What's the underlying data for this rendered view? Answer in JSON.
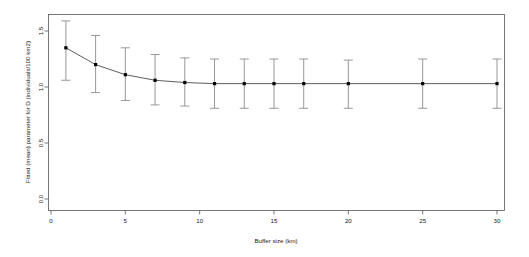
{
  "chart_data": {
    "type": "line",
    "title": "",
    "subtitle": "",
    "xlabel": "Buffer size (km)",
    "ylabel": "Fitted (mean) parameter for D (individuals/100 km2)",
    "xlim": [
      0,
      30
    ],
    "ylim": [
      0.0,
      1.65
    ],
    "grid": false,
    "legend": null,
    "x": [
      1,
      3,
      5,
      7,
      9,
      11,
      13,
      15,
      17,
      20,
      25,
      30
    ],
    "values": [
      1.35,
      1.2,
      1.11,
      1.06,
      1.04,
      1.03,
      1.03,
      1.03,
      1.03,
      1.03,
      1.03,
      1.03
    ],
    "error_lower": [
      1.06,
      0.95,
      0.88,
      0.84,
      0.83,
      0.81,
      0.81,
      0.81,
      0.81,
      0.81,
      0.81,
      0.81
    ],
    "error_upper": [
      1.59,
      1.46,
      1.35,
      1.29,
      1.26,
      1.25,
      1.25,
      1.25,
      1.25,
      1.24,
      1.25,
      1.25
    ],
    "series": [
      {
        "name": "Fitted (mean) parameter for D",
        "values": [
          1.35,
          1.2,
          1.11,
          1.06,
          1.04,
          1.03,
          1.03,
          1.03,
          1.03,
          1.03,
          1.03,
          1.03
        ]
      }
    ],
    "xticks": [
      0,
      5,
      10,
      15,
      20,
      25,
      30
    ],
    "xticklabels": [
      "0",
      "5",
      "10",
      "15",
      "20",
      "25",
      "30"
    ],
    "yticks": [
      0.0,
      0.5,
      1.0,
      1.5
    ],
    "yticklabels": [
      "0.0",
      "0.5",
      "1.0",
      "1.5"
    ],
    "marker": "filled-square",
    "errorbar_style": "capped-vertical",
    "colors": {
      "point": "#000000",
      "line": "#333333",
      "errorbar": "#8c8c8c",
      "axis": "#555555",
      "background": "#ffffff"
    }
  },
  "axes": {
    "x_title": "Buffer size (km)",
    "y_title": "Fitted (mean) parameter for D (individuals/100 km2)"
  }
}
